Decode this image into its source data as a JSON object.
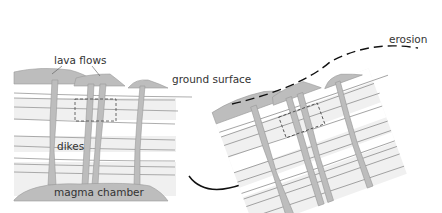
{
  "diagram": {
    "left_panel": {
      "labels": {
        "lava_flows": "lava flows",
        "ground_surface": "ground surface",
        "dikes": "dikes",
        "magma_chamber": "magma chamber"
      }
    },
    "right_panel": {
      "labels": {
        "erosion": "erosion"
      }
    },
    "colors": {
      "rock": "#bdbdbd",
      "strata_band": "#eeeeee",
      "line": "#8a8a8a",
      "text": "#333333"
    }
  }
}
